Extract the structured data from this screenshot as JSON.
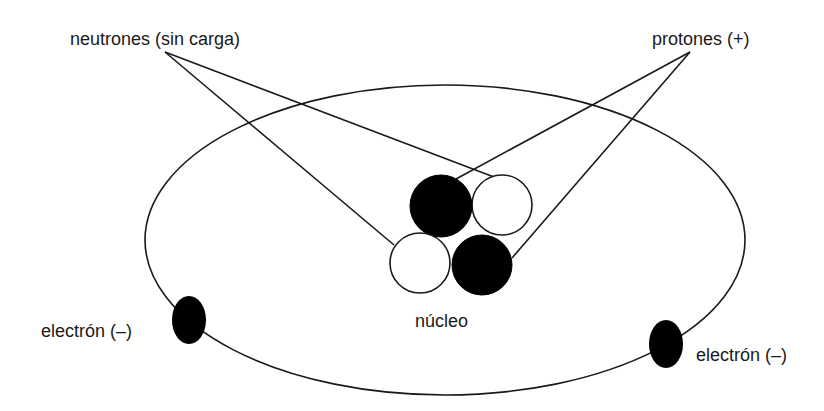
{
  "labels": {
    "neutrons": "neutrones (sin carga)",
    "protons": "protones (+)",
    "nucleus": "núcleo",
    "electron_left": "electrón (–)",
    "electron_right": "electrón (–)"
  },
  "colors": {
    "stroke": "#1a1a1a",
    "proton_fill": "#000000",
    "neutron_fill": "#ffffff",
    "electron_fill": "#000000",
    "background": "#ffffff"
  },
  "orbit": {
    "cx": 445,
    "cy": 240,
    "rx": 300,
    "ry": 155
  },
  "particles": [
    {
      "type": "proton",
      "cx": 441,
      "cy": 206,
      "r": 31
    },
    {
      "type": "neutron",
      "cx": 502,
      "cy": 205,
      "r": 30
    },
    {
      "type": "neutron",
      "cx": 420,
      "cy": 263,
      "r": 30
    },
    {
      "type": "proton",
      "cx": 482,
      "cy": 265,
      "r": 30
    }
  ],
  "electrons": [
    {
      "cx": 189,
      "cy": 320,
      "rx": 17,
      "ry": 24
    },
    {
      "cx": 666,
      "cy": 344,
      "rx": 17,
      "ry": 24
    }
  ],
  "leader_lines": [
    {
      "from": "neutrons",
      "x1": 165,
      "y1": 52,
      "x2": 494,
      "y2": 177
    },
    {
      "from": "neutrons",
      "x1": 165,
      "y1": 52,
      "x2": 394,
      "y2": 245
    },
    {
      "from": "protons",
      "x1": 690,
      "y1": 52,
      "x2": 456,
      "y2": 179
    },
    {
      "from": "protons",
      "x1": 690,
      "y1": 52,
      "x2": 512,
      "y2": 258
    }
  ]
}
